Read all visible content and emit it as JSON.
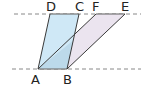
{
  "diagram": {
    "points": {
      "A": {
        "label": "A"
      },
      "B": {
        "label": "B"
      },
      "C": {
        "label": "C"
      },
      "D": {
        "label": "D"
      },
      "E": {
        "label": "E"
      },
      "F": {
        "label": "F"
      }
    },
    "shapes": [
      {
        "name": "parallelogram-ABCD",
        "vertices": [
          "A",
          "B",
          "C",
          "D"
        ],
        "fill": "#cfe8f6"
      },
      {
        "name": "parallelogram-ABEF",
        "vertices": [
          "A",
          "B",
          "E",
          "F"
        ],
        "fill": "#ebe4ef"
      }
    ],
    "overlap_fill": "#bcd9ea",
    "stroke_color": "#3a3a3a",
    "dash_color": "#888888"
  }
}
